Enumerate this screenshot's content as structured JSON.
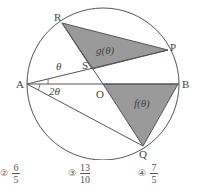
{
  "diagram": {
    "points": {
      "A": {
        "label": "A",
        "x": 27,
        "y": 84
      },
      "B": {
        "label": "B",
        "x": 180,
        "y": 84
      },
      "O": {
        "label": "O",
        "x": 103,
        "y": 84
      },
      "P": {
        "label": "P",
        "x": 168,
        "y": 50
      },
      "Q": {
        "label": "Q",
        "x": 143,
        "y": 146
      },
      "R": {
        "label": "R",
        "x": 62,
        "y": 23
      },
      "S": {
        "label": "S",
        "x": 92,
        "y": 69
      }
    },
    "circle": {
      "cx": 103,
      "cy": 84,
      "r": 76
    },
    "angle_labels": {
      "theta": "θ",
      "two_theta": "2θ"
    },
    "region_labels": {
      "g": "g(θ)",
      "f": "f(θ)"
    },
    "colors": {
      "stroke": "#555555",
      "fill": "#9a9a9a",
      "background": "#ffffff"
    }
  },
  "choices": [
    {
      "number": "②",
      "numerator": "6",
      "denominator": "5"
    },
    {
      "number": "③",
      "numerator": "13",
      "denominator": "10"
    },
    {
      "number": "④",
      "numerator": "7",
      "denominator": "5"
    }
  ]
}
